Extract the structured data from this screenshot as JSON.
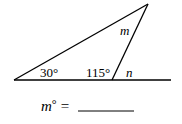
{
  "diagram": {
    "type": "triangle-exterior-angle",
    "vertices": {
      "left": {
        "x": 14,
        "y": 80
      },
      "bottom_right": {
        "x": 112,
        "y": 80
      },
      "apex": {
        "x": 148,
        "y": 4
      }
    },
    "baseline_end": {
      "x": 171,
      "y": 80
    },
    "labels": {
      "angle_left": "30°",
      "angle_interior_right": "115°",
      "angle_apex": "m",
      "angle_exterior": "n"
    }
  },
  "question": {
    "variable": "m",
    "degree": "°",
    "equals": "="
  }
}
